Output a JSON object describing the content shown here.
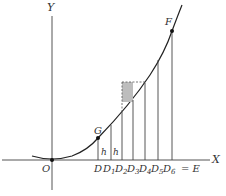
{
  "figure": {
    "axes": {
      "x_label": "X",
      "y_label": "Y",
      "origin_label": "O"
    },
    "points": {
      "G": "G",
      "F": "F"
    },
    "strip_labels": [
      "h",
      "h"
    ],
    "base_labels": [
      "D",
      "D",
      "D",
      "D",
      "D",
      "D",
      "D"
    ],
    "base_subscripts": [
      "",
      "1",
      "2",
      "3",
      "4",
      "5",
      "6"
    ],
    "end_equation": "= E",
    "colors": {
      "ink": "#333333",
      "shade": "#bdbdbd"
    }
  }
}
